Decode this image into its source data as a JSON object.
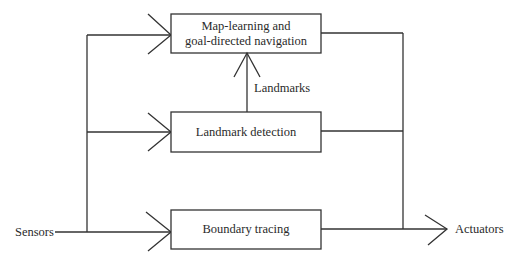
{
  "diagram": {
    "type": "block-diagram",
    "colors": {
      "stroke": "#333333",
      "text": "#2a2a2a",
      "background": "#ffffff"
    },
    "nodes": [
      {
        "id": "map_learning",
        "lines": [
          "Map-learning and",
          "goal-directed navigation"
        ]
      },
      {
        "id": "landmark_detection",
        "lines": [
          "Landmark detection"
        ]
      },
      {
        "id": "boundary_tracing",
        "lines": [
          "Boundary tracing"
        ]
      }
    ],
    "labels": {
      "input": "Sensors",
      "output": "Actuators",
      "landmarks_edge": "Landmarks"
    },
    "edges": [
      {
        "from": "Sensors",
        "to": "map_learning"
      },
      {
        "from": "Sensors",
        "to": "landmark_detection"
      },
      {
        "from": "Sensors",
        "to": "boundary_tracing"
      },
      {
        "from": "landmark_detection",
        "to": "map_learning",
        "label": "Landmarks"
      },
      {
        "from": "map_learning",
        "to": "Actuators"
      },
      {
        "from": "landmark_detection",
        "to": "Actuators"
      },
      {
        "from": "boundary_tracing",
        "to": "Actuators"
      }
    ]
  }
}
